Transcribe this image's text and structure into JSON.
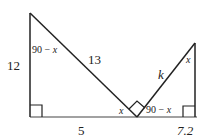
{
  "diagram": {
    "left_triangle": {
      "vertical_side": "12",
      "hypotenuse": "13",
      "base": "5",
      "top_angle": "90 − ",
      "top_angle_var": "x",
      "bottom_right_angle": "x"
    },
    "right_triangle": {
      "hypotenuse": "k",
      "base": "7.2",
      "top_angle": "x",
      "bottom_left_angle": "90 − ",
      "bottom_left_angle_var": "x"
    },
    "colors": {
      "line": "#222222",
      "background": "#ffffff"
    }
  }
}
